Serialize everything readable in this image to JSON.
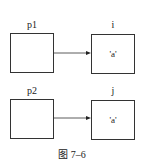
{
  "diagram": {
    "rows": [
      {
        "pointer": {
          "label": "p1"
        },
        "target": {
          "label": "i",
          "value": "'a'"
        }
      },
      {
        "pointer": {
          "label": "p2"
        },
        "target": {
          "label": "j",
          "value": "'a'"
        }
      }
    ],
    "caption": "图 7–6",
    "colors": {
      "stroke": "#333333",
      "background": "#ffffff"
    }
  }
}
